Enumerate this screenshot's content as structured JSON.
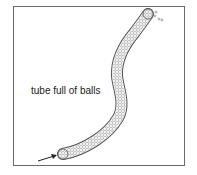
{
  "diagram": {
    "label": "tube full of balls",
    "colors": {
      "frame": "#6a6a6a",
      "tube_outline": "#555555",
      "ball": "#8a8a8a",
      "arrow": "#222222",
      "text": "#222222"
    }
  }
}
